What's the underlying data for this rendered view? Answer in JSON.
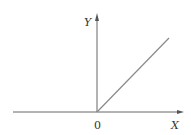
{
  "diagram": {
    "type": "function-plot",
    "y_axis_label": "Y",
    "x_axis_label": "X",
    "origin_label": "0",
    "colors": {
      "axis": "#555555",
      "line": "#888888",
      "text": "#333333"
    }
  }
}
